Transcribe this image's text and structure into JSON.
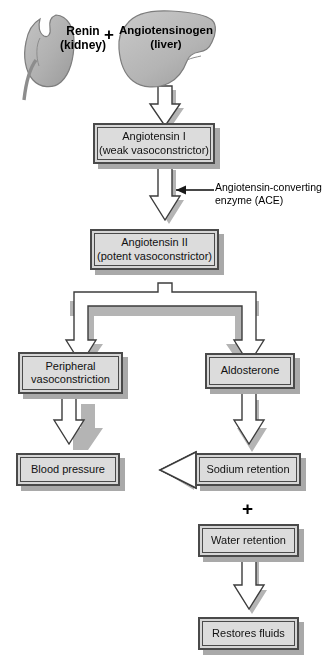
{
  "diagram": {
    "colors": {
      "box_fill": "#dcdcdc",
      "box_border": "#4a4a4a",
      "shadow": "#a9a9a9",
      "organ_fill": "#b6b6b6",
      "organ_border": "#6e6e6e",
      "arrow_fill": "#ffffff",
      "arrow_border": "#3c3c3c",
      "text": "#000000",
      "background": "#ffffff"
    },
    "organs": [
      {
        "id": "kidney",
        "label": "Renin",
        "sublabel": "(kidney)",
        "shape": "kidney-shape"
      },
      {
        "id": "liver",
        "label": "Angiotensinogen",
        "sublabel": "(liver)",
        "shape": "liver-shape"
      }
    ],
    "plus_signs": [
      {
        "id": "plus-top",
        "symbol": "+"
      },
      {
        "id": "plus-bottom",
        "symbol": "+"
      }
    ],
    "boxes": [
      {
        "id": "angiotensin-1",
        "line1": "Angiotensin I",
        "line2": "(weak vasoconstrictor)"
      },
      {
        "id": "angiotensin-2",
        "line1": "Angiotensin II",
        "line2": "(potent vasoconstrictor)"
      },
      {
        "id": "peripheral-vasoconstriction",
        "line1": "Peripheral",
        "line2": "vasoconstriction"
      },
      {
        "id": "aldosterone",
        "line1": "Aldosterone",
        "line2": ""
      },
      {
        "id": "blood-pressure",
        "line1": "Blood pressure",
        "line2": ""
      },
      {
        "id": "sodium-retention",
        "line1": "Sodium retention",
        "line2": ""
      },
      {
        "id": "water-retention",
        "line1": "Water retention",
        "line2": ""
      },
      {
        "id": "restores-fluids",
        "line1": "Restores fluids",
        "line2": ""
      }
    ],
    "annotations": [
      {
        "id": "ace",
        "line1": "Angiotensin-converting",
        "line2": "enzyme (ACE)"
      }
    ]
  }
}
